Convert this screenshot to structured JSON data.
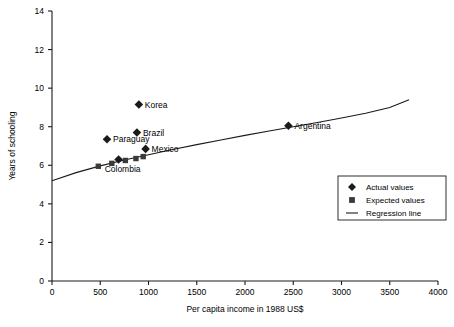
{
  "chart_data": {
    "type": "scatter",
    "title": "",
    "xlabel": "Per capita income in 1988 US$",
    "ylabel": "Years of schooling",
    "xlim": [
      0,
      4000
    ],
    "ylim": [
      0,
      14
    ],
    "xticks": [
      0,
      500,
      1000,
      1500,
      2000,
      2500,
      3000,
      3500,
      4000
    ],
    "yticks": [
      0,
      2,
      4,
      6,
      8,
      10,
      12,
      14
    ],
    "xtick_labels": [
      "0",
      "500",
      "1000",
      "1500",
      "2000",
      "2500",
      "3000",
      "3500",
      "4000"
    ],
    "ytick_labels": [
      "0",
      "2",
      "4",
      "6",
      "8",
      "10",
      "12",
      "14"
    ],
    "grid": false,
    "legend_position": "lower right",
    "series": [
      {
        "name": "Actual values",
        "marker": "diamond",
        "color": "#1a1a1a",
        "points": [
          {
            "label": "Paraguay",
            "x": 570,
            "y": 7.35,
            "label_side": "right"
          },
          {
            "label": "Colombia",
            "x": 690,
            "y": 6.3,
            "label_side": "below"
          },
          {
            "label": "Brazil",
            "x": 880,
            "y": 7.7,
            "label_side": "right"
          },
          {
            "label": "Korea",
            "x": 900,
            "y": 9.15,
            "label_side": "right"
          },
          {
            "label": "Mexico",
            "x": 970,
            "y": 6.85,
            "label_side": "right"
          },
          {
            "label": "Argentina",
            "x": 2450,
            "y": 8.05,
            "label_side": "right"
          }
        ]
      },
      {
        "name": "Expected values",
        "marker": "square",
        "color": "#3a3a3a",
        "points": [
          {
            "label": "",
            "x": 480,
            "y": 5.95
          },
          {
            "label": "",
            "x": 620,
            "y": 6.1
          },
          {
            "label": "",
            "x": 760,
            "y": 6.25
          },
          {
            "label": "",
            "x": 870,
            "y": 6.35
          },
          {
            "label": "",
            "x": 945,
            "y": 6.45
          }
        ]
      }
    ],
    "regression_line": {
      "name": "Regression line",
      "color": "#1a1a1a",
      "points": [
        {
          "x": 0,
          "y": 5.2
        },
        {
          "x": 250,
          "y": 5.62
        },
        {
          "x": 500,
          "y": 5.97
        },
        {
          "x": 750,
          "y": 6.27
        },
        {
          "x": 1000,
          "y": 6.55
        },
        {
          "x": 1250,
          "y": 6.82
        },
        {
          "x": 1500,
          "y": 7.07
        },
        {
          "x": 1750,
          "y": 7.31
        },
        {
          "x": 2000,
          "y": 7.55
        },
        {
          "x": 2250,
          "y": 7.78
        },
        {
          "x": 2500,
          "y": 8.0
        },
        {
          "x": 2750,
          "y": 8.22
        },
        {
          "x": 3000,
          "y": 8.45
        },
        {
          "x": 3250,
          "y": 8.7
        },
        {
          "x": 3500,
          "y": 9.0
        },
        {
          "x": 3700,
          "y": 9.4
        }
      ]
    },
    "legend_entries": [
      {
        "label": "Actual values",
        "marker": "diamond"
      },
      {
        "label": "Expected values",
        "marker": "square"
      },
      {
        "label": "Regression line",
        "marker": "line"
      }
    ]
  }
}
